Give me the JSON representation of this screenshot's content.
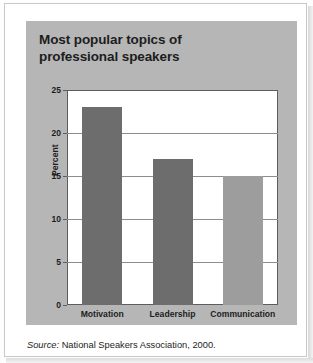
{
  "figure": {
    "title_line1": "Most popular topics of",
    "title_line2": "professional speakers",
    "source_prefix": "Source:",
    "source_text": "National Speakers Association, 2000.",
    "panel_color": "#b6b6b6",
    "plot_background": "#ffffff",
    "frame_color": "#5d5d5d"
  },
  "chart_data": {
    "type": "bar",
    "title": "Most popular topics of professional speakers",
    "xlabel": "",
    "ylabel": "Percent",
    "categories": [
      "Motivation",
      "Leadership",
      "Communication"
    ],
    "values": [
      23,
      17,
      15
    ],
    "bar_colors": [
      "#6d6d6d",
      "#6d6d6d",
      "#9d9d9d"
    ],
    "ylim": [
      0,
      25
    ],
    "yticks": [
      0,
      5,
      10,
      15,
      20,
      25
    ],
    "ytick_labels": [
      "0",
      "5",
      "10",
      "15",
      "20",
      "25"
    ],
    "grid": true,
    "grid_axis": "y",
    "legend": false,
    "source": "Source: National Speakers Association, 2000."
  }
}
